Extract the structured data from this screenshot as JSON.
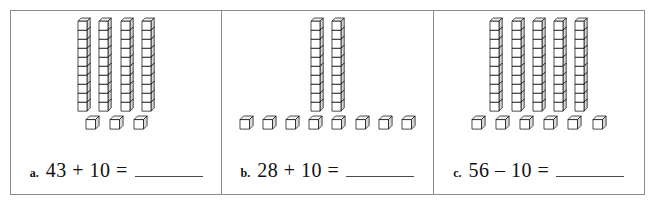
{
  "worksheet": {
    "kind": "base-ten-blocks-worksheet",
    "block_legend": {
      "rod_name": "tens-rod",
      "rod_value": 10,
      "unit_name": "unit-cube",
      "unit_value": 1
    },
    "style": {
      "border_color": "#8d8d8d",
      "ink_color": "#111111",
      "blank_line_color": "#4a4a4a",
      "cube_face_fill": "#ffffff",
      "cube_top_fill": "#f2f2f2",
      "cube_side_fill": "#d9d9d9",
      "cube_stroke": "#000000"
    },
    "problems": [
      {
        "label": "a.",
        "rods": 4,
        "units": 3,
        "rod_cubes": 10,
        "first_number": "43",
        "operator": "+",
        "second_number": "10",
        "equals": "=",
        "equation": "43 + 10 =",
        "answer": ""
      },
      {
        "label": "b.",
        "rods": 2,
        "units": 8,
        "rod_cubes": 10,
        "first_number": "28",
        "operator": "+",
        "second_number": "10",
        "equals": "=",
        "equation": "28 + 10 =",
        "answer": ""
      },
      {
        "label": "c.",
        "rods": 5,
        "units": 6,
        "rod_cubes": 10,
        "first_number": "56",
        "operator": "–",
        "second_number": "10",
        "equals": "=",
        "equation": "56 – 10 =",
        "answer": ""
      }
    ]
  }
}
